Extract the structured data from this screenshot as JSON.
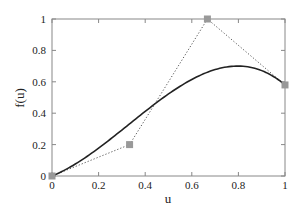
{
  "chart_data": {
    "type": "line",
    "title": "",
    "xlabel": "u",
    "ylabel": "f(u)",
    "xlim": [
      0,
      1
    ],
    "ylim": [
      0,
      1
    ],
    "grid": false,
    "legend": null,
    "x_ticks": [
      "0",
      "0.2",
      "0.4",
      "0.6",
      "0.8",
      "1"
    ],
    "y_ticks": [
      "0",
      "0.2",
      "0.4",
      "0.6",
      "0.8",
      "1"
    ],
    "series": [
      {
        "name": "curve",
        "style": "solid",
        "color": "#222222",
        "x": [
          0,
          0.1,
          0.2,
          0.3,
          0.4,
          0.5,
          0.6,
          0.7,
          0.8,
          0.9,
          1.0
        ],
        "y": [
          0,
          0.06,
          0.13,
          0.22,
          0.35,
          0.52,
          0.68,
          0.78,
          0.77,
          0.69,
          0.58
        ]
      },
      {
        "name": "control polygon",
        "style": "dotted",
        "color": "#555555",
        "marker": "square",
        "marker_color": "#999999",
        "x": [
          0,
          0.333,
          0.667,
          1.0
        ],
        "y": [
          0,
          0.2,
          1.0,
          0.58
        ]
      }
    ]
  }
}
